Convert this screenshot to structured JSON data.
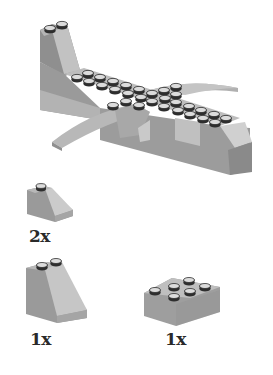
{
  "model": {
    "name": "airplane-model",
    "colors": {
      "dark": "#8f8f8f",
      "mid": "#a9a9a9",
      "light": "#c8c8c8",
      "top": "#b9b9b9",
      "stud_top": "#e4e4e4",
      "stud_side": "#2e2e2e"
    }
  },
  "parts": [
    {
      "id": "slope-1x2",
      "label": "2x"
    },
    {
      "id": "slope-2x2",
      "label": "1x"
    },
    {
      "id": "brick-2x3",
      "label": "1x"
    }
  ]
}
